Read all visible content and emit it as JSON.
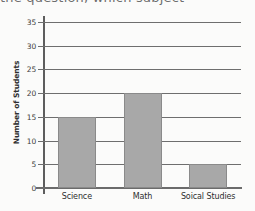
{
  "page": {
    "cutoff_line": "the question, which subject"
  },
  "chart_data": {
    "type": "bar",
    "title": "",
    "xlabel": "",
    "ylabel": "Number of Students",
    "categories": [
      "Science",
      "Math",
      "Soical Studies"
    ],
    "values": [
      15,
      20,
      5
    ],
    "ylim": [
      0,
      35
    ],
    "ytick_step": 5,
    "yticks": [
      0,
      5,
      10,
      15,
      20,
      25,
      30,
      35
    ],
    "ytick_labels": [
      "0",
      "5",
      "10",
      "15",
      "20",
      "25",
      "30",
      "35"
    ],
    "grid": true,
    "grid_axis": "y",
    "legend": false,
    "legend_position": "none",
    "bar_color": "#a8a8a8",
    "bar_edge_color": "#8a8a8a",
    "axis_color": "#6b6b6b",
    "gridline_color": "#6e6e6e",
    "background_color": "#fbfbfa"
  }
}
